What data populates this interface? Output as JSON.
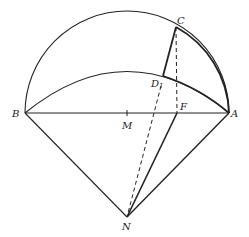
{
  "diagram": {
    "labels": {
      "A": "A",
      "B": "B",
      "C": "C",
      "D": "D",
      "D_sub": "1",
      "F": "F",
      "M": "M",
      "N": "N"
    },
    "points": {
      "A": [
        229,
        113
      ],
      "B": [
        25,
        113
      ],
      "M": [
        127,
        113
      ],
      "C": [
        176,
        27
      ],
      "D1": [
        163,
        76
      ],
      "F": [
        177,
        113
      ],
      "N": [
        127,
        217
      ]
    },
    "stroke_color": "#222222",
    "background": "#ffffff"
  }
}
